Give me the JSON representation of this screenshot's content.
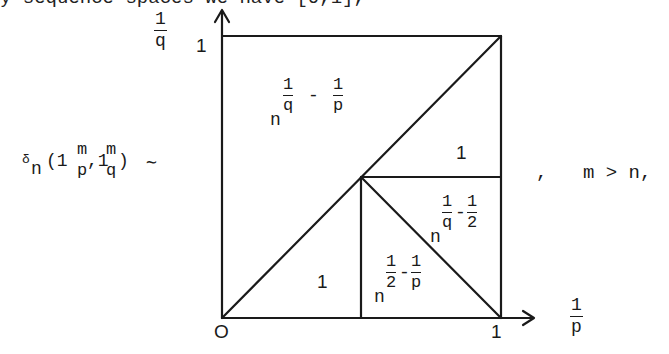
{
  "top_line_clipped": "     y         sequence spaces we have [0,1],",
  "lhs": {
    "delta": "δ",
    "sub_n": "n",
    "open": "(1",
    "sup_m1": "m",
    "sub_p": "p",
    "comma": ",1",
    "sup_m2": "m",
    "sub_q": "q",
    "close": ")",
    "sim": "∼"
  },
  "rhs": {
    "comma": ",",
    "condition": "m > n,"
  },
  "axes": {
    "y_label_num": "1",
    "y_label_den": "q",
    "y_tick": "1",
    "x_label_num": "1",
    "x_label_den": "p",
    "x_tick": "1",
    "origin": "O"
  },
  "regions": {
    "upper_left": {
      "base": "n",
      "e1_num": "1",
      "e1_den": "q",
      "minus": "-",
      "e2_num": "1",
      "e2_den": "p"
    },
    "right_mid": {
      "value": "1"
    },
    "right_triangle": {
      "base": "n",
      "e1_num": "1",
      "e1_den": "q",
      "minus": "-",
      "e2_num": "1",
      "e2_den": "2"
    },
    "lower_left": {
      "value": "1"
    },
    "lower_mid": {
      "base": "n",
      "e1_num": "1",
      "e1_den": "2",
      "minus": "-",
      "e2_num": "1",
      "e2_den": "p"
    }
  },
  "geometry": {
    "origin": [
      222,
      318
    ],
    "top_left": [
      222,
      36
    ],
    "top_right": [
      501,
      36
    ],
    "bottom_right": [
      501,
      318
    ],
    "center": [
      361,
      177
    ]
  }
}
